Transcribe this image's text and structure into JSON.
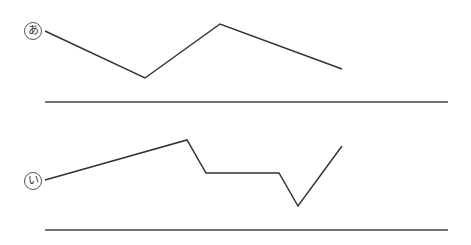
{
  "diagram": {
    "figures": [
      {
        "id": "a",
        "label": "あ",
        "label_pos": [
          24,
          22
        ],
        "polyline": [
          [
            45,
            31
          ],
          [
            145,
            78
          ],
          [
            220,
            24
          ],
          [
            342,
            69
          ]
        ],
        "baseline": {
          "x1": 45,
          "x2": 448,
          "y": 102
        }
      },
      {
        "id": "i",
        "label": "い",
        "label_pos": [
          24,
          172
        ],
        "polyline": [
          [
            45,
            180
          ],
          [
            187,
            140
          ],
          [
            206,
            173
          ],
          [
            279,
            173
          ],
          [
            298,
            206
          ],
          [
            342,
            146
          ]
        ],
        "baseline": {
          "x1": 45,
          "x2": 448,
          "y": 230
        }
      }
    ],
    "colors": {
      "line": "#333333",
      "baseline": "#444444",
      "background": "#ffffff"
    }
  }
}
